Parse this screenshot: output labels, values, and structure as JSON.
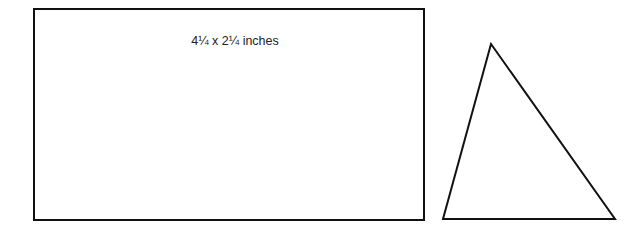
{
  "rectangle": {
    "label": "4¼ x 2¼ inches"
  },
  "triangle": {
    "points": "491,44 443,219 615,219"
  }
}
